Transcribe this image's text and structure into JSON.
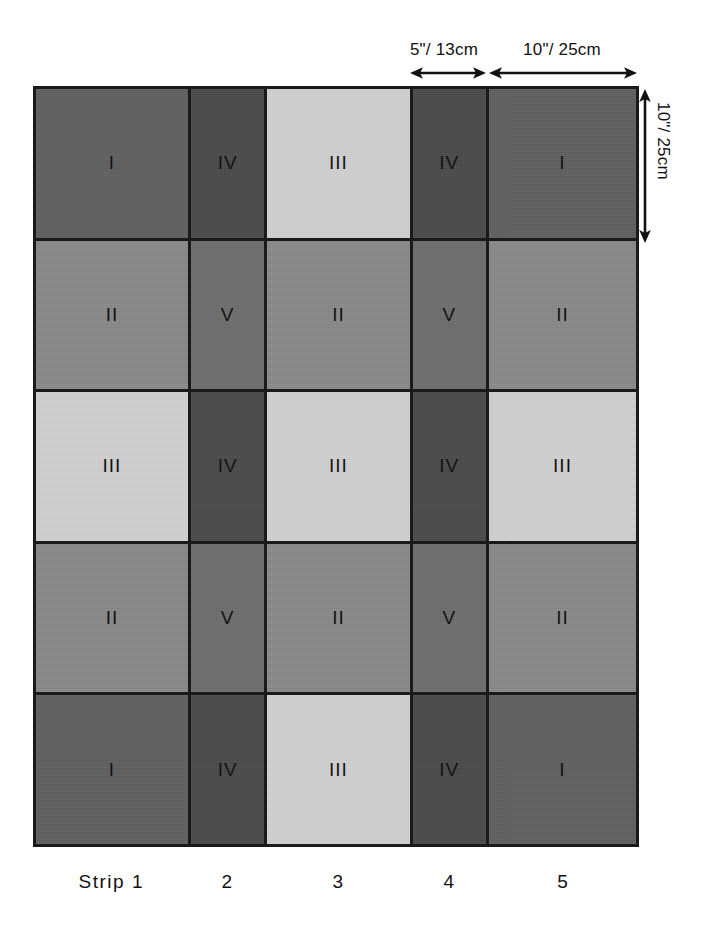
{
  "figure": {
    "annotations": {
      "top_left_dim": "5\"/ 13cm",
      "top_right_dim": "10\"/ 25cm",
      "right_vertical_dim": "10\"/ 25cm"
    },
    "strip_captions": [
      "Strip 1",
      "2",
      "3",
      "4",
      "5"
    ]
  },
  "chart_data": {
    "type": "heatmap",
    "xlabel": "",
    "ylabel": "",
    "grid": true,
    "legend_position": "none",
    "columns": [
      "Strip 1",
      "2",
      "3",
      "4",
      "5"
    ],
    "rows": [
      "Row 1",
      "Row 2",
      "Row 3",
      "Row 4",
      "Row 5"
    ],
    "column_widths_in": [
      10,
      5,
      10,
      5,
      10
    ],
    "row_heights_in": [
      10,
      10,
      10,
      10,
      10
    ],
    "treatment_colors": {
      "I": "#606060",
      "II": "#8a8a8a",
      "III": "#d2d2d2",
      "IV": "#4a4a4a",
      "V": "#6e6e6e"
    },
    "cells": [
      [
        {
          "label": "I",
          "color": "#606060"
        },
        {
          "label": "IV",
          "color": "#4a4a4a"
        },
        {
          "label": "III",
          "color": "#d2d2d2"
        },
        {
          "label": "IV",
          "color": "#4a4a4a"
        },
        {
          "label": "I",
          "color": "#606060"
        }
      ],
      [
        {
          "label": "II",
          "color": "#8a8a8a"
        },
        {
          "label": "V",
          "color": "#6e6e6e"
        },
        {
          "label": "II",
          "color": "#8a8a8a"
        },
        {
          "label": "V",
          "color": "#6e6e6e"
        },
        {
          "label": "II",
          "color": "#8a8a8a"
        }
      ],
      [
        {
          "label": "III",
          "color": "#d2d2d2"
        },
        {
          "label": "IV",
          "color": "#4a4a4a"
        },
        {
          "label": "III",
          "color": "#d2d2d2"
        },
        {
          "label": "IV",
          "color": "#4a4a4a"
        },
        {
          "label": "III",
          "color": "#d2d2d2"
        }
      ],
      [
        {
          "label": "II",
          "color": "#8a8a8a"
        },
        {
          "label": "V",
          "color": "#6e6e6e"
        },
        {
          "label": "II",
          "color": "#8a8a8a"
        },
        {
          "label": "V",
          "color": "#6e6e6e"
        },
        {
          "label": "II",
          "color": "#8a8a8a"
        }
      ],
      [
        {
          "label": "I",
          "color": "#606060"
        },
        {
          "label": "IV",
          "color": "#4a4a4a"
        },
        {
          "label": "III",
          "color": "#d2d2d2"
        },
        {
          "label": "IV",
          "color": "#4a4a4a"
        },
        {
          "label": "I",
          "color": "#606060"
        }
      ]
    ],
    "annotations": [
      {
        "text": "5\"/ 13cm",
        "orientation": "horizontal",
        "spans": "column 4"
      },
      {
        "text": "10\"/ 25cm",
        "orientation": "horizontal",
        "spans": "column 5"
      },
      {
        "text": "10\"/ 25cm",
        "orientation": "vertical",
        "spans": "row 1"
      }
    ]
  }
}
